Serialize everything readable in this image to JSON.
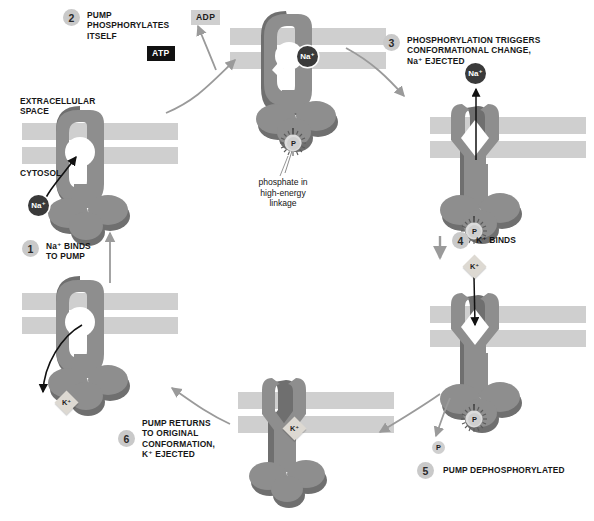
{
  "diagram": {
    "colors": {
      "membrane": "#cfcfcf",
      "protein": "#8e8e8e",
      "protein_shadow": "#6f6f6f",
      "step_circle": "#c9c9c9",
      "atp_bg": "#111111",
      "adp_bg": "#cfcfcf",
      "na_ion": "#3a3a3a",
      "k_ion": "#ddd9d2",
      "arrow_gray": "#9a9a9a",
      "arrow_black": "#111111"
    }
  },
  "region_labels": {
    "extracellular": "EXTRACELLULAR\nSPACE",
    "cytosol": "CYTOSOL"
  },
  "steps": [
    {
      "number": "1",
      "text": "Na⁺ BINDS\nTO PUMP"
    },
    {
      "number": "2",
      "text": "PUMP\nPHOSPHORYLATES\nITSELF"
    },
    {
      "number": "3",
      "text": "PHOSPHORYLATION TRIGGERS\nCONFORMATIONAL CHANGE,\nNa⁺ EJECTED"
    },
    {
      "number": "4",
      "text": "K⁺ BINDS"
    },
    {
      "number": "5",
      "text": "PUMP DEPHOSPHORYLATED"
    },
    {
      "number": "6",
      "text": "PUMP RETURNS\nTO ORIGINAL\nCONFORMATION,\nK⁺ EJECTED"
    }
  ],
  "molecules": {
    "atp": "ATP",
    "adp": "ADP",
    "sodium": "Na⁺",
    "potassium": "K⁺",
    "phosphate": "P"
  },
  "annotations": {
    "phosphate_note": "phosphate in\nhigh-energy\nlinkage"
  }
}
